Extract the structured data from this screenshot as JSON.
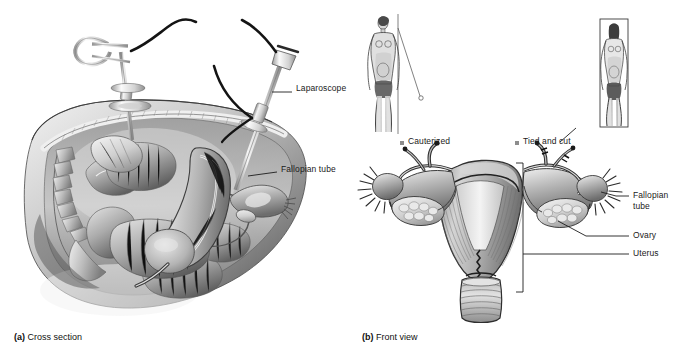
{
  "figure": {
    "background": "#ffffff"
  },
  "panel_a": {
    "caption_marker": "(a)",
    "caption_text": " Cross section",
    "view": "sagittal cross section of female pelvis with laparoscopic instruments",
    "labels": [
      {
        "id": "laparoscope",
        "text": "Laparoscope",
        "x": 296,
        "y": 88
      },
      {
        "id": "fallopian-tube",
        "text": "Fallopian tube",
        "x": 281,
        "y": 169
      }
    ],
    "instruments": [
      {
        "name": "grasping-forceps",
        "description": "ring-handled surgical instrument through trocar"
      },
      {
        "name": "laparoscope",
        "description": "laparoscope with fiber-optic light cable"
      }
    ]
  },
  "panel_b": {
    "caption_marker": "(b)",
    "caption_text": " Front view",
    "view": "anterior view of uterus, fallopian tubes and ovaries",
    "legend": [
      {
        "id": "cauterized",
        "text": "Cauterized",
        "x": 408,
        "y": 137,
        "swatch": "#8d8d8d"
      },
      {
        "id": "tied-and-cut",
        "text": "Tied and cut",
        "x": 523,
        "y": 137,
        "swatch": "#8d8d8d"
      }
    ],
    "labels": [
      {
        "id": "fallopian-tube-line1",
        "text": "Fallopian",
        "x": 633,
        "y": 194
      },
      {
        "id": "fallopian-tube-line2",
        "text": "tube",
        "x": 633,
        "y": 205
      },
      {
        "id": "ovary",
        "text": "Ovary",
        "x": 633,
        "y": 233
      },
      {
        "id": "uterus",
        "text": "Uterus",
        "x": 633,
        "y": 250
      }
    ],
    "body_figures": [
      {
        "id": "body-figure-left",
        "framed": false,
        "note": "standing female figure, cauterized side"
      },
      {
        "id": "body-figure-right",
        "framed": true,
        "note": "standing female figure in box, tied and cut side"
      }
    ]
  },
  "colors": {
    "ink": "#1a1a1a",
    "tissue_light": "#d8d8d8",
    "tissue_mid": "#a8a8a8",
    "tissue_dark": "#6e6e6e",
    "metal_light": "#e8e8e8",
    "metal_dark": "#9a9a9a",
    "legend_swatch": "#8d8d8d"
  }
}
